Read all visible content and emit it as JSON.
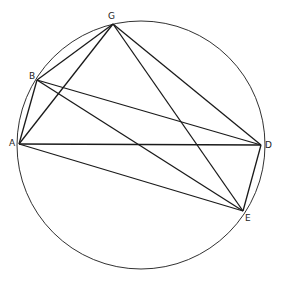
{
  "diagram": {
    "type": "inscribed-polygon-in-circle",
    "circle": {
      "cx": 141,
      "cy": 145,
      "r": 124
    },
    "points": {
      "A": {
        "x": 19,
        "y": 144,
        "label": "A"
      },
      "B": {
        "x": 37,
        "y": 80,
        "label": "B"
      },
      "G": {
        "x": 113,
        "y": 24,
        "label": "G"
      },
      "D": {
        "x": 261,
        "y": 145,
        "label": "D"
      },
      "E": {
        "x": 243,
        "y": 211,
        "label": "E"
      }
    },
    "segments": [
      [
        "A",
        "B"
      ],
      [
        "A",
        "G"
      ],
      [
        "A",
        "D"
      ],
      [
        "A",
        "E"
      ],
      [
        "B",
        "G"
      ],
      [
        "B",
        "D"
      ],
      [
        "B",
        "E"
      ],
      [
        "G",
        "D"
      ],
      [
        "G",
        "E"
      ],
      [
        "D",
        "E"
      ]
    ],
    "colors": {
      "stroke": "#1a1a1a",
      "background": "#ffffff"
    }
  }
}
